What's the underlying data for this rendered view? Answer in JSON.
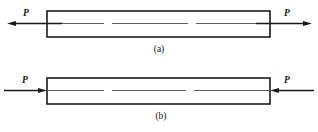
{
  "figure": {
    "canvas": {
      "width": 318,
      "height": 132,
      "background": "#ffffff"
    },
    "line_color": "#1a1a1a",
    "centerline_color": "#4a4a4a",
    "panels": [
      {
        "id": "panel-a",
        "caption": "(a)",
        "caption_x": 159,
        "caption_y": 52,
        "loading": "tension",
        "bar": {
          "x": 47,
          "y": 11,
          "width": 223,
          "height": 26
        },
        "axis_y": 23.5,
        "centerline_segments": [
          {
            "x1": 40,
            "x2": 104
          },
          {
            "x1": 112,
            "x2": 188
          },
          {
            "x1": 196,
            "x2": 278
          }
        ],
        "left_load": {
          "label": "P",
          "label_x": 26,
          "label_y": 16,
          "direction": "left",
          "tip_x": 7,
          "tail_x": 62,
          "head_length": 9,
          "head_half_width": 2.6
        },
        "right_load": {
          "label": "P",
          "label_x": 287,
          "label_y": 16,
          "direction": "right",
          "tip_x": 312,
          "tail_x": 256,
          "head_length": 9,
          "head_half_width": 2.6
        }
      },
      {
        "id": "panel-b",
        "caption": "(b)",
        "caption_x": 161,
        "caption_y": 119,
        "loading": "compression",
        "bar": {
          "x": 47,
          "y": 78,
          "width": 223,
          "height": 26
        },
        "axis_y": 90.5,
        "centerline_segments": [
          {
            "x1": 47,
            "x2": 104
          },
          {
            "x1": 112,
            "x2": 186
          },
          {
            "x1": 194,
            "x2": 270
          }
        ],
        "left_load": {
          "label": "P",
          "label_x": 25,
          "label_y": 83,
          "direction": "right",
          "tip_x": 47,
          "tail_x": 4,
          "head_length": 9,
          "head_half_width": 2.6
        },
        "right_load": {
          "label": "P",
          "label_x": 287,
          "label_y": 83,
          "direction": "left",
          "tip_x": 270,
          "tail_x": 314,
          "head_length": 9,
          "head_half_width": 2.6
        }
      }
    ]
  }
}
